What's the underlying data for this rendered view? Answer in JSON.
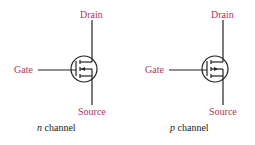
{
  "diagram": {
    "colors": {
      "label": "#b5325a",
      "line": "#222222",
      "caption": "#222222"
    },
    "symbols": [
      {
        "id": "n",
        "labels": {
          "drain": "Drain",
          "gate": "Gate",
          "source": "Source"
        },
        "caption_var": "n",
        "caption_text": " channel"
      },
      {
        "id": "p",
        "labels": {
          "drain": "Drain",
          "gate": "Gate",
          "source": "Source"
        },
        "caption_var": "p",
        "caption_text": " channel"
      }
    ]
  }
}
